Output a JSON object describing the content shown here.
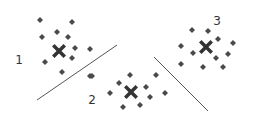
{
  "diagram": {
    "type": "clustering",
    "colors": {
      "point": "#4a4a4a",
      "centroid": "#333333",
      "line": "#555555"
    },
    "clusters": [
      {
        "label": "1",
        "label_pos": [
          19,
          60
        ],
        "centroid": [
          59,
          51
        ],
        "points": [
          [
            40,
            20
          ],
          [
            72,
            22
          ],
          [
            42,
            37
          ],
          [
            57,
            32
          ],
          [
            68,
            37
          ],
          [
            75,
            48
          ],
          [
            90,
            49
          ],
          [
            72,
            58
          ],
          [
            45,
            62
          ],
          [
            62,
            72
          ],
          [
            90,
            76
          ]
        ]
      },
      {
        "label": "2",
        "label_pos": [
          92,
          100
        ],
        "centroid": [
          131,
          92
        ],
        "points": [
          [
            92,
            76
          ],
          [
            130,
            75
          ],
          [
            156,
            75
          ],
          [
            119,
            83
          ],
          [
            146,
            87
          ],
          [
            110,
            93
          ],
          [
            150,
            97
          ],
          [
            165,
            93
          ],
          [
            123,
            107
          ],
          [
            140,
            105
          ]
        ]
      },
      {
        "label": "3",
        "label_pos": [
          217,
          21
        ],
        "centroid": [
          206,
          47
        ],
        "points": [
          [
            192,
            30
          ],
          [
            208,
            31
          ],
          [
            181,
            46
          ],
          [
            218,
            39
          ],
          [
            233,
            43
          ],
          [
            193,
            53
          ],
          [
            216,
            58
          ],
          [
            228,
            54
          ],
          [
            181,
            64
          ],
          [
            203,
            67
          ],
          [
            223,
            67
          ]
        ]
      }
    ],
    "boundaries": [
      {
        "from": [
          37,
          100
        ],
        "to": [
          117,
          45
        ]
      },
      {
        "from": [
          154,
          57
        ],
        "to": [
          208,
          111
        ]
      }
    ]
  }
}
